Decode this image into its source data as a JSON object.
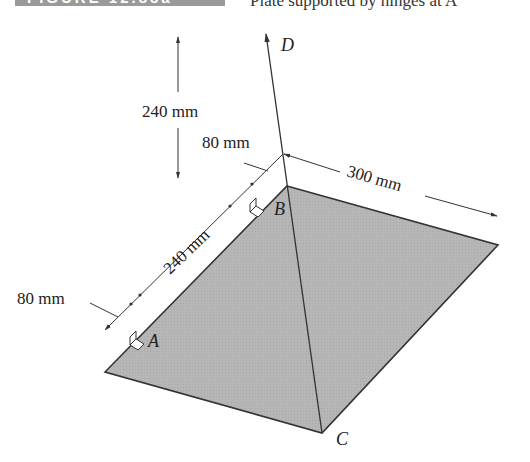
{
  "header": {
    "figure_label": "FIGURE 12.88a",
    "caption": "Plate supported by hinges at A"
  },
  "diagram": {
    "points": {
      "A": "A",
      "B": "B",
      "C": "C",
      "D": "D"
    },
    "dimensions": {
      "vertical_height": "240 mm",
      "edge_offset_top": "80 mm",
      "hinge_spacing": "240 mm",
      "edge_offset_bottom": "80 mm",
      "plate_width": "300 mm"
    },
    "colors": {
      "plate_fill": "#b4b4b4",
      "line": "#333333",
      "header_band": "#9a9a9a"
    }
  }
}
